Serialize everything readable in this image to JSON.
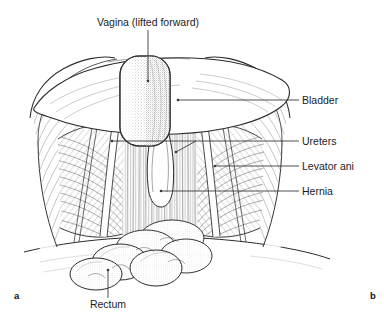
{
  "figure": {
    "type": "anatomical-line-drawing",
    "background_color": "#ffffff",
    "ink_color": "#2b2b2b",
    "label_color": "#1c1c1c"
  },
  "labels": {
    "vagina": "Vagina (lifted forward)",
    "bladder": "Bladder",
    "ureters": "Ureters",
    "levator_ani": "Levator ani",
    "hernia": "Hernia",
    "rectum": "Rectum"
  },
  "panel_markers": {
    "left": "a",
    "right": "b"
  },
  "structures": [
    {
      "name": "vagina",
      "label": "Vagina (lifted forward)",
      "render": "stippled-rounded-rectangle",
      "position": "top-center"
    },
    {
      "name": "bladder",
      "label": "Bladder",
      "render": "broad-dome",
      "position": "upper-center"
    },
    {
      "name": "ureters",
      "label": "Ureters",
      "render": "paired-thin-tubes",
      "position": "mid-center"
    },
    {
      "name": "levator-ani",
      "label": "Levator ani",
      "render": "hatched-muscle-sheet",
      "position": "mid-left-and-right"
    },
    {
      "name": "hernia",
      "label": "Hernia",
      "render": "midline-white-slit",
      "position": "mid-center"
    },
    {
      "name": "rectum",
      "label": "Rectum",
      "render": "stippled-bowel-loops",
      "position": "bottom-center"
    }
  ]
}
